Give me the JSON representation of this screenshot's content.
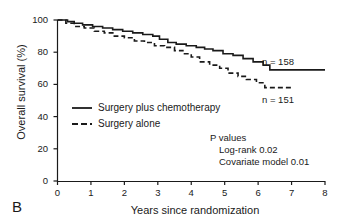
{
  "panel": {
    "label": "B"
  },
  "chart_data": {
    "type": "line",
    "title": "",
    "subtitle": "",
    "xlabel": "Years since randomization",
    "ylabel": "Overall survival (%)",
    "xlim": [
      0,
      8
    ],
    "ylim": [
      0,
      100
    ],
    "xticks": [
      "0",
      "1",
      "2",
      "3",
      "4",
      "5",
      "6",
      "7",
      "8"
    ],
    "yticks": [
      "0",
      "20",
      "40",
      "60",
      "80",
      "100"
    ],
    "grid": false,
    "legend_position": "inside-left-middle",
    "series": [
      {
        "name": "Surgery plus chemotherapy",
        "style": "solid",
        "color": "#1a1a1a",
        "n_label": "n = 158",
        "final_value": 69,
        "points": [
          [
            0.0,
            100
          ],
          [
            0.25,
            100
          ],
          [
            0.3,
            99
          ],
          [
            0.45,
            99
          ],
          [
            0.5,
            98
          ],
          [
            0.7,
            98
          ],
          [
            0.75,
            97
          ],
          [
            1.0,
            97
          ],
          [
            1.05,
            96
          ],
          [
            1.3,
            96
          ],
          [
            1.35,
            95
          ],
          [
            1.6,
            95
          ],
          [
            1.65,
            94
          ],
          [
            1.9,
            94
          ],
          [
            1.95,
            93
          ],
          [
            2.2,
            93
          ],
          [
            2.25,
            92
          ],
          [
            2.5,
            92
          ],
          [
            2.55,
            91
          ],
          [
            2.8,
            91
          ],
          [
            2.85,
            90
          ],
          [
            3.0,
            90
          ],
          [
            3.05,
            88
          ],
          [
            3.25,
            88
          ],
          [
            3.3,
            86
          ],
          [
            3.5,
            86
          ],
          [
            3.55,
            85
          ],
          [
            3.8,
            85
          ],
          [
            3.85,
            84
          ],
          [
            4.1,
            84
          ],
          [
            4.15,
            83
          ],
          [
            4.35,
            83
          ],
          [
            4.4,
            82
          ],
          [
            4.6,
            82
          ],
          [
            4.65,
            81
          ],
          [
            4.9,
            81
          ],
          [
            4.95,
            79
          ],
          [
            5.2,
            79
          ],
          [
            5.25,
            78
          ],
          [
            5.5,
            78
          ],
          [
            5.55,
            76
          ],
          [
            5.8,
            76
          ],
          [
            5.85,
            74
          ],
          [
            6.1,
            74
          ],
          [
            6.15,
            72
          ],
          [
            6.3,
            72
          ],
          [
            6.35,
            69
          ],
          [
            8.0,
            69
          ]
        ]
      },
      {
        "name": "Surgery alone",
        "style": "dashed",
        "color": "#1a1a1a",
        "n_label": "n = 151",
        "final_value": 58,
        "points": [
          [
            0.0,
            100
          ],
          [
            0.2,
            100
          ],
          [
            0.25,
            98
          ],
          [
            0.45,
            98
          ],
          [
            0.5,
            96
          ],
          [
            0.75,
            96
          ],
          [
            0.8,
            95
          ],
          [
            1.05,
            95
          ],
          [
            1.1,
            93
          ],
          [
            1.35,
            93
          ],
          [
            1.4,
            92
          ],
          [
            1.65,
            92
          ],
          [
            1.7,
            90
          ],
          [
            1.95,
            90
          ],
          [
            2.0,
            89
          ],
          [
            2.25,
            89
          ],
          [
            2.3,
            87
          ],
          [
            2.55,
            87
          ],
          [
            2.6,
            86
          ],
          [
            2.85,
            86
          ],
          [
            2.9,
            84
          ],
          [
            3.15,
            84
          ],
          [
            3.2,
            83
          ],
          [
            3.45,
            83
          ],
          [
            3.5,
            81
          ],
          [
            3.7,
            81
          ],
          [
            3.75,
            79
          ],
          [
            3.95,
            79
          ],
          [
            4.0,
            77
          ],
          [
            4.2,
            77
          ],
          [
            4.25,
            74
          ],
          [
            4.5,
            74
          ],
          [
            4.55,
            72
          ],
          [
            4.8,
            72
          ],
          [
            4.85,
            70
          ],
          [
            5.05,
            70
          ],
          [
            5.1,
            67
          ],
          [
            5.35,
            67
          ],
          [
            5.4,
            65
          ],
          [
            5.6,
            65
          ],
          [
            5.65,
            63
          ],
          [
            5.9,
            63
          ],
          [
            5.95,
            61
          ],
          [
            6.15,
            61
          ],
          [
            6.2,
            58
          ],
          [
            7.0,
            58
          ]
        ]
      }
    ],
    "annotations": {
      "p_values_title": "P values",
      "p_logrank": "Log-rank 0.02",
      "p_covariate": "Covariate model 0.01"
    }
  }
}
